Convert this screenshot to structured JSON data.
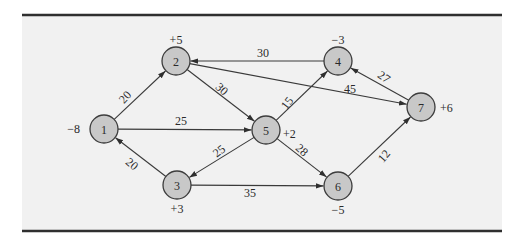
{
  "figure": {
    "panel": {
      "x": 22,
      "y": 15,
      "width": 480,
      "height": 216,
      "background": "#f1f1f1",
      "rule_color": "#2f2f2f"
    },
    "node_fill": "#c8c8c8",
    "node_stroke": "#3c3c3c",
    "node_radius": 14,
    "nodes": [
      {
        "id": "1",
        "label": "1",
        "x": 104,
        "y": 129,
        "supply": "−8",
        "supply_x": 80,
        "supply_y": 129,
        "supply_anchor": "end"
      },
      {
        "id": "2",
        "label": "2",
        "x": 176,
        "y": 61,
        "supply": "+5",
        "supply_x": 176,
        "supply_y": 40,
        "supply_anchor": "middle"
      },
      {
        "id": "3",
        "label": "3",
        "x": 177,
        "y": 185,
        "supply": "+3",
        "supply_x": 177,
        "supply_y": 209,
        "supply_anchor": "middle"
      },
      {
        "id": "4",
        "label": "4",
        "x": 338,
        "y": 61,
        "supply": "−3",
        "supply_x": 338,
        "supply_y": 40,
        "supply_anchor": "middle"
      },
      {
        "id": "5",
        "label": "5",
        "x": 266,
        "y": 130,
        "supply": "+2",
        "supply_x": 283,
        "supply_y": 134,
        "supply_anchor": "start"
      },
      {
        "id": "6",
        "label": "6",
        "x": 338,
        "y": 186,
        "supply": "−5",
        "supply_x": 338,
        "supply_y": 210,
        "supply_anchor": "middle"
      },
      {
        "id": "7",
        "label": "7",
        "x": 421,
        "y": 107,
        "supply": "+6",
        "supply_x": 440,
        "supply_y": 108,
        "supply_anchor": "start"
      }
    ],
    "edges": [
      {
        "from": "1",
        "to": "2",
        "cost": "20",
        "label_x": 125,
        "label_y": 97,
        "label_rot": -48
      },
      {
        "from": "1",
        "to": "5",
        "cost": "25",
        "label_x": 181,
        "label_y": 121,
        "label_rot": 0
      },
      {
        "from": "3",
        "to": "1",
        "cost": "20",
        "label_x": 132,
        "label_y": 164,
        "label_rot": 40
      },
      {
        "from": "2",
        "to": "5",
        "cost": "30",
        "label_x": 222,
        "label_y": 89,
        "label_rot": 42
      },
      {
        "from": "4",
        "to": "2",
        "cost": "30",
        "label_x": 263,
        "label_y": 53,
        "label_rot": 0
      },
      {
        "from": "2",
        "to": "7",
        "cost": "45",
        "label_x": 350,
        "label_y": 89,
        "label_rot": 0
      },
      {
        "from": "5",
        "to": "4",
        "cost": "15",
        "label_x": 287,
        "label_y": 103,
        "label_rot": -52
      },
      {
        "from": "5",
        "to": "3",
        "cost": "25",
        "label_x": 219,
        "label_y": 151,
        "label_rot": -38
      },
      {
        "from": "5",
        "to": "6",
        "cost": "28",
        "label_x": 302,
        "label_y": 150,
        "label_rot": 42
      },
      {
        "from": "3",
        "to": "6",
        "cost": "35",
        "label_x": 250,
        "label_y": 193,
        "label_rot": 0
      },
      {
        "from": "7",
        "to": "4",
        "cost": "27",
        "label_x": 384,
        "label_y": 77,
        "label_rot": 35
      },
      {
        "from": "6",
        "to": "7",
        "cost": "12",
        "label_x": 384,
        "label_y": 156,
        "label_rot": -50
      }
    ]
  }
}
